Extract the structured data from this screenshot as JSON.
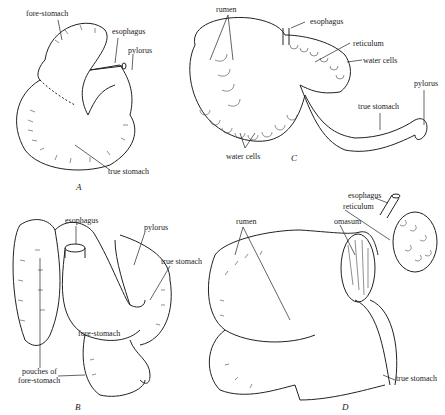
{
  "figure": {
    "panels": [
      {
        "id": "A",
        "letter": "A",
        "labels": [
          "fore-stomach",
          "esophagus",
          "pylorus",
          "true stomach"
        ]
      },
      {
        "id": "B",
        "letter": "B",
        "labels": [
          "esophagus",
          "pylorus",
          "true stomach",
          "fore-stomach",
          "pouches of",
          "fore-stomach"
        ]
      },
      {
        "id": "C",
        "letter": "C",
        "labels": [
          "rumen",
          "esophagus",
          "reticulum",
          "water cells",
          "pylorus",
          "true stomach",
          "water cells"
        ]
      },
      {
        "id": "D",
        "letter": "D",
        "labels": [
          "esophagus",
          "reticulum",
          "omasum",
          "rumen",
          "true stomach"
        ]
      }
    ]
  }
}
